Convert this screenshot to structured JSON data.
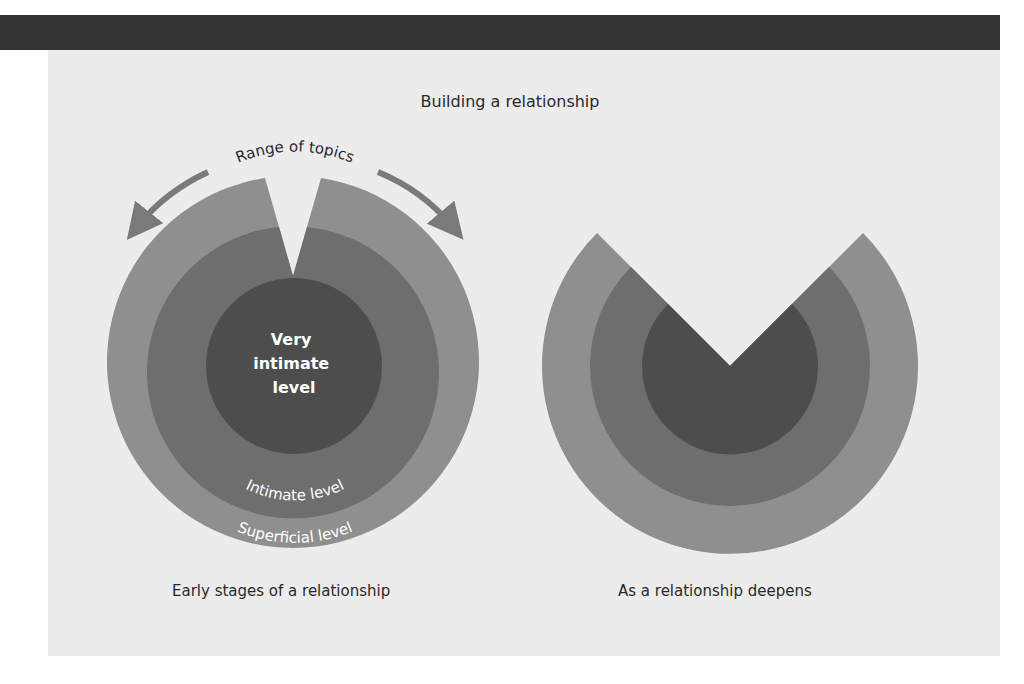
{
  "header_bar": {
    "color": "#343434"
  },
  "figure": {
    "title": "Building a relationship",
    "left_diagram": {
      "caption": "Early stages of a relationship",
      "arrow_label": "Range of topics",
      "layers": [
        {
          "name": "Superficial level",
          "label": "Superficial level",
          "color": "#8f8f8f"
        },
        {
          "name": "Intimate level",
          "label": "Intimate level",
          "color": "#6e6e6e"
        },
        {
          "name": "Very intimate level",
          "label_lines": [
            "Very",
            "intimate",
            "level"
          ],
          "color": "#4d4d4d"
        }
      ]
    },
    "right_diagram": {
      "caption": "As a relationship deepens"
    },
    "colors": {
      "panel_bg": "#ececec",
      "outer": "#8f8f8f",
      "middle": "#6e6e6e",
      "inner": "#4d4d4d",
      "arrow": "#7a7a7a",
      "text_dark": "#2a2a2a",
      "text_light": "#ffffff"
    }
  }
}
